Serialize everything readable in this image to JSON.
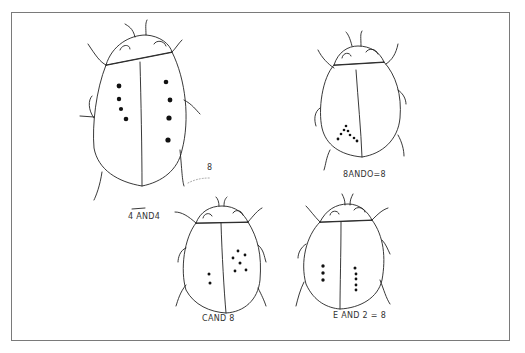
{
  "figure": {
    "stroke_color": "#222222",
    "border_color": "#7a7a7a"
  },
  "beetles": [
    {
      "id": "large",
      "label": "4 AND 4",
      "label_raw": "4 AND4",
      "left_spots": 4,
      "right_spots": 4
    },
    {
      "id": "top-right",
      "label": "8 AND 0 = 8",
      "label_raw": "8ANDO=8",
      "left_spots": 8,
      "right_spots": 0
    },
    {
      "id": "bottom-center",
      "label": "2 AND 6",
      "label_raw": "CAND 8",
      "left_spots": 2,
      "right_spots": 6
    },
    {
      "id": "bottom-right",
      "label": "3 AND 5 = 8",
      "label_raw": "E AND 2 = 8",
      "left_spots": 3,
      "right_spots": 5
    }
  ],
  "labels": {
    "large": "4 AND4",
    "top_right": "8ANDO=8",
    "bottom_center": "CAND 8",
    "bottom_right": "E AND 2 = 8",
    "stray_eight": "8"
  }
}
